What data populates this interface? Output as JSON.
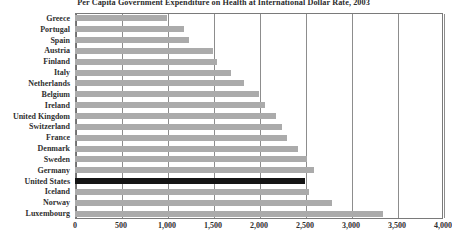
{
  "chart_data": {
    "type": "bar",
    "orientation": "horizontal",
    "title": "Per Capita Government Expenditure on Health at International Dollar Rate, 2003",
    "xlabel": "",
    "ylabel": "",
    "xlim": [
      0,
      4000
    ],
    "xticks": [
      0,
      500,
      1000,
      1500,
      2000,
      2500,
      3000,
      3500,
      4000
    ],
    "xtick_labels": [
      "0",
      "500",
      "1,000",
      "1,500",
      "2,000",
      "2,500",
      "3,000",
      "3,500",
      "4,000"
    ],
    "grid": true,
    "legend": "none",
    "bar_color": "#ababab",
    "highlight_color": "#141414",
    "highlight_category": "United States",
    "categories": [
      "Greece",
      "Portugal",
      "Spain",
      "Austria",
      "Finland",
      "Italy",
      "Netherlands",
      "Belgium",
      "Ireland",
      "United Kingdom",
      "Switzerland",
      "France",
      "Denmark",
      "Sweden",
      "Germany",
      "United States",
      "Iceland",
      "Norway",
      "Luxembourg"
    ],
    "values": [
      1000,
      1190,
      1240,
      1500,
      1540,
      1700,
      1840,
      2000,
      2060,
      2180,
      2250,
      2300,
      2420,
      2520,
      2600,
      2500,
      2540,
      2790,
      3350
    ]
  }
}
